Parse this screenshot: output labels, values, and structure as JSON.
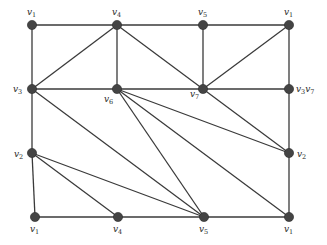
{
  "diagram": {
    "type": "graph",
    "edge_color": "#3a3a3a",
    "node_color": "#444444",
    "nodes": [
      {
        "id": "n1",
        "label": "v",
        "sub": "1",
        "x": 32,
        "y": 25,
        "lx": 27,
        "ly": 15
      },
      {
        "id": "n2",
        "label": "v",
        "sub": "4",
        "x": 117,
        "y": 25,
        "lx": 112,
        "ly": 15
      },
      {
        "id": "n3",
        "label": "v",
        "sub": "5",
        "x": 203,
        "y": 25,
        "lx": 198,
        "ly": 15
      },
      {
        "id": "n4",
        "label": "v",
        "sub": "1",
        "x": 289,
        "y": 25,
        "lx": 284,
        "ly": 15
      },
      {
        "id": "n5",
        "label": "v",
        "sub": "3",
        "x": 32,
        "y": 89,
        "lx": 13,
        "ly": 92
      },
      {
        "id": "n6",
        "label": "v",
        "sub": "6",
        "x": 117,
        "y": 89,
        "lx": 104,
        "ly": 102
      },
      {
        "id": "n7",
        "label": "v",
        "sub": "7",
        "x": 203,
        "y": 89,
        "lx": 190,
        "ly": 97
      },
      {
        "id": "n8",
        "label": "v",
        "sub": "3",
        "label2": "v",
        "sub2": "7",
        "x": 289,
        "y": 89,
        "lx": 296,
        "ly": 92
      },
      {
        "id": "n9",
        "label": "v",
        "sub": "2",
        "x": 32,
        "y": 153,
        "lx": 14,
        "ly": 157
      },
      {
        "id": "n10",
        "label": "v",
        "sub": "2",
        "x": 289,
        "y": 153,
        "lx": 297,
        "ly": 157
      },
      {
        "id": "n11",
        "label": "v",
        "sub": "1",
        "x": 35,
        "y": 217,
        "lx": 30,
        "ly": 232
      },
      {
        "id": "n12",
        "label": "v",
        "sub": "4",
        "x": 118,
        "y": 217,
        "lx": 113,
        "ly": 232
      },
      {
        "id": "n13",
        "label": "v",
        "sub": "5",
        "x": 204,
        "y": 217,
        "lx": 199,
        "ly": 232
      },
      {
        "id": "n14",
        "label": "v",
        "sub": "1",
        "x": 289,
        "y": 217,
        "lx": 284,
        "ly": 232
      }
    ],
    "edges": [
      [
        "n1",
        "n2"
      ],
      [
        "n2",
        "n3"
      ],
      [
        "n3",
        "n4"
      ],
      [
        "n1",
        "n5"
      ],
      [
        "n2",
        "n5"
      ],
      [
        "n2",
        "n6"
      ],
      [
        "n2",
        "n7"
      ],
      [
        "n3",
        "n7"
      ],
      [
        "n4",
        "n7"
      ],
      [
        "n4",
        "n8"
      ],
      [
        "n5",
        "n6"
      ],
      [
        "n6",
        "n7"
      ],
      [
        "n7",
        "n8"
      ],
      [
        "n5",
        "n9"
      ],
      [
        "n9",
        "n11"
      ],
      [
        "n5",
        "n13"
      ],
      [
        "n6",
        "n13"
      ],
      [
        "n6",
        "n10"
      ],
      [
        "n6",
        "n14"
      ],
      [
        "n7",
        "n10"
      ],
      [
        "n8",
        "n10"
      ],
      [
        "n10",
        "n14"
      ],
      [
        "n9",
        "n12"
      ],
      [
        "n9",
        "n13"
      ],
      [
        "n11",
        "n12"
      ],
      [
        "n12",
        "n13"
      ],
      [
        "n13",
        "n14"
      ]
    ]
  }
}
